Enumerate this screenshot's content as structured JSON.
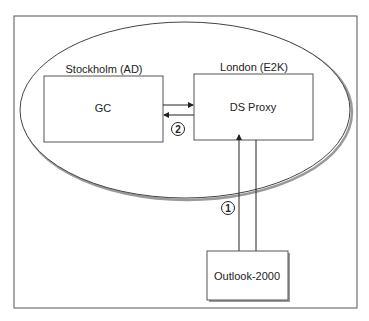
{
  "diagram": {
    "site_labels": {
      "stockholm": "Stockholm (AD)",
      "london": "London (E2K)"
    },
    "nodes": {
      "gc": "GC",
      "ds_proxy": "DS Proxy",
      "outlook": "Outlook-2000"
    },
    "steps": {
      "one": "1",
      "two": "2"
    },
    "colors": {
      "line": "#333333",
      "frame": "#555555",
      "shadow": "#9a9a9a"
    }
  }
}
